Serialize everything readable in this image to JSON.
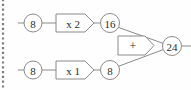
{
  "diagram": {
    "background_color": "#fefefe",
    "stroke_color": "#8a8a8a",
    "text_color": "#2b2b2b",
    "margin_rule": {
      "name": "dotted-left-margin",
      "x": 3,
      "y_start": 0,
      "y_end": 90
    },
    "nodes": [
      {
        "id": "in-top",
        "label": "8",
        "shape": "circle",
        "cx": 33,
        "cy": 23,
        "r": 9
      },
      {
        "id": "op-top",
        "label": "x 2",
        "shape": "pentagon",
        "x": 56,
        "y": 14,
        "w": 38,
        "h": 18
      },
      {
        "id": "mid-top",
        "label": "16",
        "shape": "circle",
        "cx": 110,
        "cy": 23,
        "r": 9.5
      },
      {
        "id": "in-bot",
        "label": "8",
        "shape": "circle",
        "cx": 33,
        "cy": 70,
        "r": 9
      },
      {
        "id": "op-bot",
        "label": "x 1",
        "shape": "pentagon",
        "x": 56,
        "y": 61,
        "w": 38,
        "h": 18
      },
      {
        "id": "mid-bot",
        "label": "8",
        "shape": "circle",
        "cx": 110,
        "cy": 70,
        "r": 9.5
      },
      {
        "id": "op-sum",
        "label": "+",
        "shape": "pentagon",
        "x": 118,
        "y": 36,
        "w": 36,
        "h": 19
      },
      {
        "id": "out",
        "label": "24",
        "shape": "circle",
        "cx": 172,
        "cy": 46,
        "r": 9.5
      }
    ],
    "edges": [
      {
        "from": "input-stub-top",
        "to": "in-top"
      },
      {
        "from": "in-top",
        "to": "op-top"
      },
      {
        "from": "op-top",
        "to": "mid-top"
      },
      {
        "from": "mid-top",
        "to": "out"
      },
      {
        "from": "input-stub-bottom",
        "to": "in-bot"
      },
      {
        "from": "in-bot",
        "to": "op-bot"
      },
      {
        "from": "op-bot",
        "to": "mid-bot"
      },
      {
        "from": "mid-bot",
        "to": "out"
      },
      {
        "from": "out",
        "to": "output-stub"
      }
    ]
  }
}
